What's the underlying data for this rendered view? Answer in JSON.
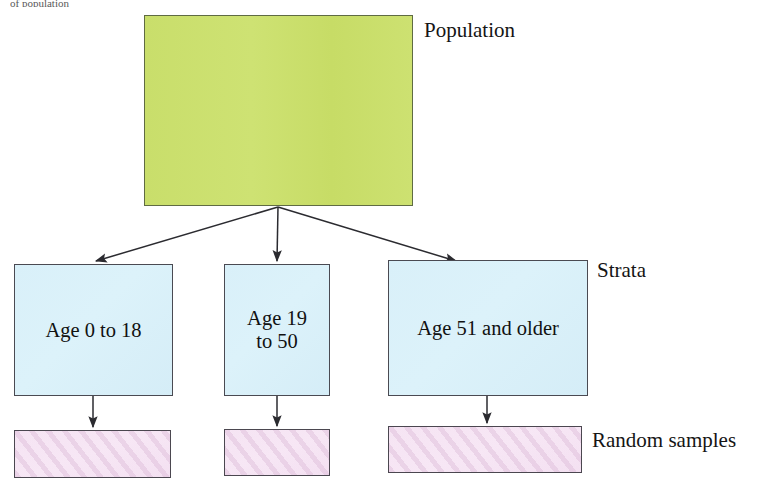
{
  "diagram": {
    "title_fragment": "of population",
    "population": {
      "label": "Population",
      "box_text": "",
      "color": "#cbe06c"
    },
    "strata": {
      "label": "Strata",
      "color": "#d9f0f9",
      "boxes": [
        {
          "text": "Age 0 to 18"
        },
        {
          "text": "Age 19\nto 50"
        },
        {
          "text": "Age 51 and older"
        }
      ]
    },
    "samples": {
      "label": "Random samples",
      "color": "#f4e2f2",
      "boxes": [
        {
          "text": ""
        },
        {
          "text": ""
        },
        {
          "text": ""
        }
      ]
    },
    "arrow_color": "#2b2b30"
  },
  "chart_data": {
    "type": "diagram",
    "levels": [
      {
        "name": "Population",
        "nodes": [
          ""
        ]
      },
      {
        "name": "Strata",
        "nodes": [
          "Age 0 to 18",
          "Age 19 to 50",
          "Age 51 and older"
        ]
      },
      {
        "name": "Random samples",
        "nodes": [
          "",
          "",
          ""
        ]
      }
    ],
    "edges": [
      {
        "from": "Population",
        "to": "Age 0 to 18"
      },
      {
        "from": "Population",
        "to": "Age 19 to 50"
      },
      {
        "from": "Population",
        "to": "Age 51 and older"
      },
      {
        "from": "Age 0 to 18",
        "to": "Random sample 1"
      },
      {
        "from": "Age 19 to 50",
        "to": "Random sample 2"
      },
      {
        "from": "Age 51 and older",
        "to": "Random sample 3"
      }
    ]
  }
}
